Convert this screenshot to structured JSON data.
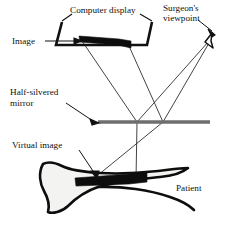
{
  "figure": {
    "type": "optical-see-through-ar-surgery-diagram",
    "background_color": "#ffffff",
    "ink_color": "#111111",
    "mirror_color": "#6e6e6e",
    "fill_color": "#f2f2f0",
    "width": 228,
    "height": 227
  },
  "labels": {
    "computer_display": "Computer display",
    "surgeons_viewpoint_line1": "Surgeon's",
    "surgeons_viewpoint_line2": "viewpoint",
    "image": "Image",
    "half_silvered_line1": "Half-silvered",
    "half_silvered_line2": "mirror",
    "virtual_image": "Virtual image",
    "patient": "Patient"
  },
  "components": {
    "display_housing": "trapezoid-monitor-bezel",
    "displayed_image": "dark-tapered-bone-graphic",
    "mirror": "half-silvered-mirror-bar",
    "eye": "surgeon-eye-arrowhead",
    "patient_limb": "outlined-leg-contour",
    "virtual_bone": "dark-bone-overlay-in-limb"
  },
  "rays": {
    "count": 4,
    "description": "two light rays from the computer display reflect off the half-silvered mirror to the surgeon's eye; two sight lines continue through the mirror to the bone inside the patient"
  }
}
